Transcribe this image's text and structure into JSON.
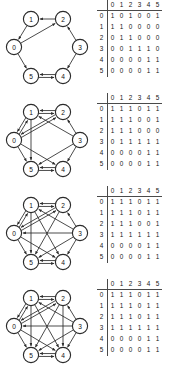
{
  "figure": {
    "node_labels": [
      "0",
      "1",
      "2",
      "3",
      "4",
      "5"
    ],
    "matrix_col_headers": [
      "0",
      "1",
      "2",
      "3",
      "4",
      "5"
    ],
    "matrix_row_headers": [
      "0",
      "1",
      "2",
      "3",
      "4",
      "5"
    ],
    "corner_label": ""
  },
  "chart_data": {
    "type": "table",
    "title": "",
    "xlabel": "",
    "ylabel": "",
    "panels": [
      {
        "name": "panel-1",
        "nodes": [
          "0",
          "1",
          "2",
          "3",
          "4",
          "5"
        ],
        "matrix": [
          [
            "1",
            "0",
            "1",
            "0",
            "0",
            "1"
          ],
          [
            "1",
            "1",
            "0",
            "0",
            "0",
            "0"
          ],
          [
            "0",
            "1",
            "1",
            "0",
            "0",
            "0"
          ],
          [
            "0",
            "0",
            "1",
            "1",
            "1",
            "0"
          ],
          [
            "0",
            "0",
            "0",
            "0",
            "1",
            "1"
          ],
          [
            "0",
            "0",
            "0",
            "0",
            "1",
            "1"
          ]
        ],
        "edges": [
          [
            0,
            0
          ],
          [
            0,
            2
          ],
          [
            0,
            5
          ],
          [
            1,
            0
          ],
          [
            1,
            1
          ],
          [
            2,
            1
          ],
          [
            2,
            2
          ],
          [
            3,
            2
          ],
          [
            3,
            3
          ],
          [
            3,
            4
          ],
          [
            4,
            4
          ],
          [
            4,
            5
          ],
          [
            5,
            4
          ],
          [
            5,
            5
          ]
        ]
      },
      {
        "name": "panel-2",
        "nodes": [
          "0",
          "1",
          "2",
          "3",
          "4",
          "5"
        ],
        "matrix": [
          [
            "1",
            "1",
            "1",
            "0",
            "1",
            "1"
          ],
          [
            "1",
            "1",
            "1",
            "0",
            "0",
            "1"
          ],
          [
            "1",
            "1",
            "1",
            "0",
            "0",
            "0"
          ],
          [
            "0",
            "1",
            "1",
            "1",
            "1",
            "1"
          ],
          [
            "0",
            "0",
            "0",
            "0",
            "1",
            "1"
          ],
          [
            "0",
            "0",
            "0",
            "0",
            "1",
            "1"
          ]
        ],
        "edges": [
          [
            0,
            0
          ],
          [
            0,
            1
          ],
          [
            0,
            2
          ],
          [
            0,
            4
          ],
          [
            0,
            5
          ],
          [
            1,
            0
          ],
          [
            1,
            1
          ],
          [
            1,
            2
          ],
          [
            1,
            5
          ],
          [
            2,
            0
          ],
          [
            2,
            1
          ],
          [
            2,
            2
          ],
          [
            3,
            1
          ],
          [
            3,
            2
          ],
          [
            3,
            3
          ],
          [
            3,
            4
          ],
          [
            3,
            5
          ],
          [
            4,
            4
          ],
          [
            4,
            5
          ],
          [
            5,
            4
          ],
          [
            5,
            5
          ]
        ]
      },
      {
        "name": "panel-3",
        "nodes": [
          "0",
          "1",
          "2",
          "3",
          "4",
          "5"
        ],
        "matrix": [
          [
            "1",
            "1",
            "1",
            "0",
            "1",
            "1"
          ],
          [
            "1",
            "1",
            "1",
            "0",
            "1",
            "1"
          ],
          [
            "1",
            "1",
            "1",
            "0",
            "0",
            "1"
          ],
          [
            "1",
            "1",
            "1",
            "1",
            "1",
            "1"
          ],
          [
            "0",
            "0",
            "0",
            "0",
            "1",
            "1"
          ],
          [
            "0",
            "0",
            "0",
            "0",
            "1",
            "1"
          ]
        ],
        "edges": [
          [
            0,
            0
          ],
          [
            0,
            1
          ],
          [
            0,
            2
          ],
          [
            0,
            4
          ],
          [
            0,
            5
          ],
          [
            1,
            0
          ],
          [
            1,
            1
          ],
          [
            1,
            2
          ],
          [
            1,
            4
          ],
          [
            1,
            5
          ],
          [
            2,
            0
          ],
          [
            2,
            1
          ],
          [
            2,
            2
          ],
          [
            2,
            5
          ],
          [
            3,
            0
          ],
          [
            3,
            1
          ],
          [
            3,
            2
          ],
          [
            3,
            3
          ],
          [
            3,
            4
          ],
          [
            3,
            5
          ],
          [
            4,
            4
          ],
          [
            4,
            5
          ],
          [
            5,
            4
          ],
          [
            5,
            5
          ]
        ]
      },
      {
        "name": "panel-4",
        "nodes": [
          "0",
          "1",
          "2",
          "3",
          "4",
          "5"
        ],
        "matrix": [
          [
            "1",
            "1",
            "1",
            "0",
            "1",
            "1"
          ],
          [
            "1",
            "1",
            "1",
            "0",
            "1",
            "1"
          ],
          [
            "1",
            "1",
            "1",
            "0",
            "1",
            "1"
          ],
          [
            "1",
            "1",
            "1",
            "1",
            "1",
            "1"
          ],
          [
            "0",
            "0",
            "0",
            "0",
            "1",
            "1"
          ],
          [
            "0",
            "0",
            "0",
            "0",
            "1",
            "1"
          ]
        ],
        "edges": [
          [
            0,
            0
          ],
          [
            0,
            1
          ],
          [
            0,
            2
          ],
          [
            0,
            4
          ],
          [
            0,
            5
          ],
          [
            1,
            0
          ],
          [
            1,
            1
          ],
          [
            1,
            2
          ],
          [
            1,
            4
          ],
          [
            1,
            5
          ],
          [
            2,
            0
          ],
          [
            2,
            1
          ],
          [
            2,
            2
          ],
          [
            2,
            4
          ],
          [
            2,
            5
          ],
          [
            3,
            0
          ],
          [
            3,
            1
          ],
          [
            3,
            2
          ],
          [
            3,
            3
          ],
          [
            3,
            4
          ],
          [
            3,
            5
          ],
          [
            4,
            4
          ],
          [
            4,
            5
          ],
          [
            5,
            4
          ],
          [
            5,
            5
          ]
        ]
      }
    ]
  }
}
